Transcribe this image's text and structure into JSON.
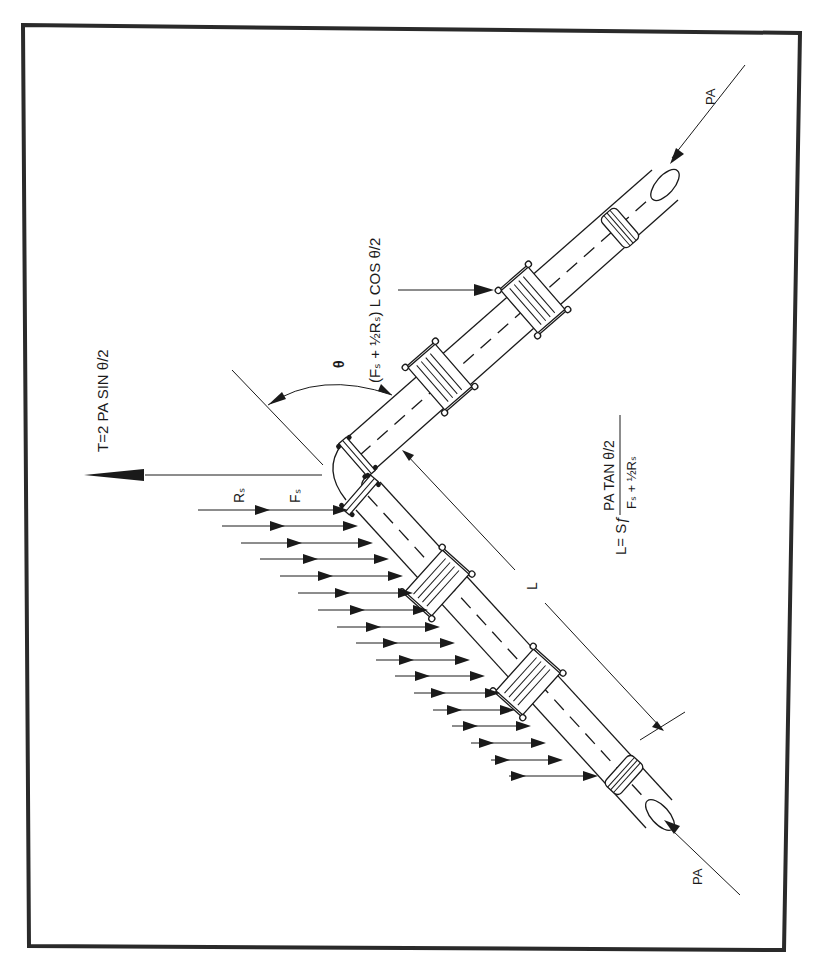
{
  "figure": {
    "orientation": "rotated 90 degrees counter-clockwise",
    "border_color": "#2a2a2a",
    "line_color": "#1a1a1a",
    "labels": {
      "thrust_equation": "T=2 PA SIN θ/2",
      "angle_symbol": "θ",
      "friction_force_equation": "(Fₛ + ½Rₛ) L COS θ/2",
      "resistance_label": "Rₛ",
      "friction_label": "Fₛ",
      "length_label": "L",
      "length_equation_lhs": "L= Sƒ",
      "length_equation_numerator": "PA TAN θ/2",
      "length_equation_denominator": "Fₛ + ½Rₛ",
      "pa_top": "PA",
      "pa_bottom": "PA"
    },
    "components": {
      "pipe_segments": 2,
      "elbow": 1,
      "restrained_couplings_per_leg": 2,
      "plain_couplings_per_leg": 1,
      "soil_resistance_arrows": 17
    }
  }
}
